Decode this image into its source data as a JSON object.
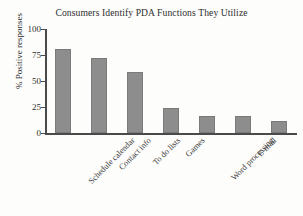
{
  "chart_data": {
    "type": "bar",
    "title": "Consumers Identify PDA Functions They Utilize",
    "xlabel": "",
    "ylabel": "% Positive responses",
    "categories": [
      "Schedule calendar",
      "Contact info",
      "To do lists",
      "Games",
      "Word processing",
      "E-mail",
      "Expense programs"
    ],
    "values": [
      81,
      72,
      59,
      24,
      16.5,
      16,
      12
    ],
    "ylim": [
      0,
      100
    ],
    "yticks": [
      0,
      25,
      50,
      75,
      100
    ],
    "ytick_labels": [
      "0",
      "25",
      "50",
      "75",
      "100"
    ],
    "grid": false,
    "legend": false,
    "legend_position": "none",
    "bar_color": "#8d8d8d",
    "axis_color": "#4a4a4a",
    "background_color": "#fdfdfc",
    "text_color": "#2e2e2e"
  }
}
